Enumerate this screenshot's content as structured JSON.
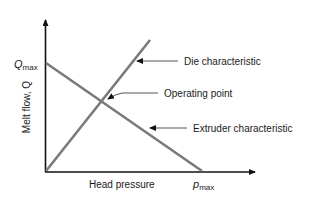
{
  "diagram": {
    "y_axis": {
      "label": "Melt flow, Q",
      "max_label_main": "Q",
      "max_label_sub": "max"
    },
    "x_axis": {
      "label": "Head pressure",
      "max_label_main": "p",
      "max_label_sub": "max"
    },
    "callouts": {
      "die": "Die characteristic",
      "operating": "Operating point",
      "extruder": "Extruder characteristic"
    },
    "colors": {
      "curve": "#7a7a7a",
      "axis": "#111111",
      "text": "#1a1a1a"
    }
  }
}
